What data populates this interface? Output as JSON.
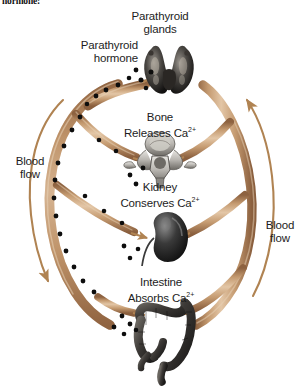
{
  "page": {
    "truncated_caption": "hormone:",
    "background_color": "#ffffff"
  },
  "diagram": {
    "title_labels": {
      "parathyroid_glands": "Parathyroid\nglands",
      "parathyroid_glands_line1": "Parathyroid",
      "parathyroid_glands_line2": "glands",
      "parathyroid_hormone_line1": "Parathyroid",
      "parathyroid_hormone_line2": "hormone",
      "bone_line1": "Bone",
      "bone_line2": "Releases Ca",
      "bone_sup": "2+",
      "kidney_line1": "Kidney",
      "kidney_line2": "Conserves Ca",
      "kidney_sup": "2+",
      "intestine_line1": "Intestine",
      "intestine_line2": "Absorbs Ca",
      "intestine_sup": "2+",
      "blood_flow_left_line1": "Blood",
      "blood_flow_left_line2": "flow",
      "blood_flow_right_line1": "Blood",
      "blood_flow_right_line2": "flow"
    },
    "colors": {
      "vessel_fill": "#c9a178",
      "vessel_fill_light": "#ddc0a0",
      "vessel_edge": "#8d6240",
      "arrow": "#b08352",
      "hormone_dot": "#0d0d0d",
      "organ_dark": "#2e2e2e",
      "organ_mid": "#6e6e6e",
      "organ_light": "#bdbdbd",
      "text": "#1d1d1d",
      "background": "#ffffff"
    },
    "organs": [
      {
        "name": "parathyroid-glands",
        "shape": "butterfly-thyroid",
        "tone": "dark"
      },
      {
        "name": "vertebra",
        "shape": "vertebra-superior-view",
        "tone": "light-gray"
      },
      {
        "name": "kidney",
        "shape": "bean",
        "tone": "dark"
      },
      {
        "name": "large-intestine",
        "shape": "colon-frame",
        "tone": "dark-gray"
      }
    ],
    "hormone_dot_count": 28,
    "flow_arrow_directions": {
      "left": "downward",
      "right": "upward"
    }
  }
}
